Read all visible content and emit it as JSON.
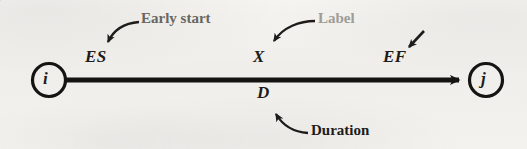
{
  "figure": {
    "kind": "activity-on-arrow-network-notation",
    "background_color": "#f2f1ee",
    "ink_color": "#1d1c1a"
  },
  "nodes": {
    "start": {
      "label": "i",
      "cx": 49,
      "cy": 80,
      "r": 17
    },
    "end": {
      "label": "j",
      "cx": 486,
      "cy": 80,
      "r": 17
    }
  },
  "arrow": {
    "x1": 66,
    "x2": 468,
    "y": 80,
    "thickness": 5
  },
  "annotations": {
    "early_start": {
      "symbol": "ES",
      "callout": "Early start"
    },
    "activity_label": {
      "symbol": "X",
      "callout": "Label"
    },
    "early_finish": {
      "symbol": "EF",
      "callout": ""
    },
    "duration": {
      "symbol": "D",
      "callout": "Duration"
    }
  }
}
